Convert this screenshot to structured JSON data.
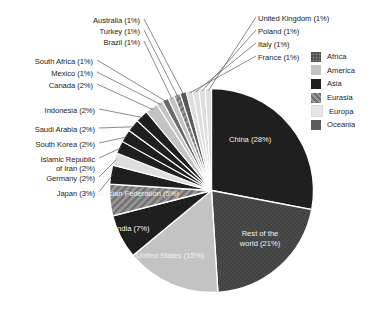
{
  "chart_data": {
    "type": "pie",
    "title": "",
    "subtitle": "",
    "xlabel": "",
    "ylabel": "",
    "legend_position": "right",
    "grid": false,
    "units": "percent",
    "categories": [
      "China",
      "Rest of the world",
      "United States",
      "India",
      "Russian Federation",
      "Japan",
      "Germany",
      "Islamic Republic of Iran",
      "South Korea",
      "Saudi Arabia",
      "Indonesia",
      "Canada",
      "Mexico",
      "South Africa",
      "Brazil",
      "Turkey",
      "Australia",
      "France",
      "Italy",
      "Poland",
      "United Kingdom"
    ],
    "values": [
      28,
      21,
      15,
      7,
      5,
      3,
      2,
      2,
      2,
      2,
      2,
      2,
      1,
      1,
      1,
      1,
      1,
      1,
      1,
      1,
      1
    ],
    "slices": [
      {
        "label": "China (28%)",
        "name": "China",
        "value": 28,
        "group": "Asia",
        "color": "#1f1f1f",
        "pattern": "solid"
      },
      {
        "label": "Rest of the world (21%)",
        "name": "Rest of the world",
        "value": 21,
        "group": "Africa",
        "color": "#4a4a4a",
        "pattern": "dots"
      },
      {
        "label": "United States (15%)",
        "name": "United States",
        "value": 15,
        "group": "America",
        "color": "#c3c3c3",
        "pattern": "solid"
      },
      {
        "label": "India (7%)",
        "name": "India",
        "value": 7,
        "group": "Asia",
        "color": "#1f1f1f",
        "pattern": "solid"
      },
      {
        "label": "Russian Federation (5%)",
        "name": "Russian Federation",
        "value": 5,
        "group": "Eurasia",
        "color": "#8c8c8c",
        "pattern": "hatch"
      },
      {
        "label": "Japan (3%)",
        "name": "Japan",
        "value": 3,
        "group": "Asia",
        "color": "#1f1f1f",
        "pattern": "solid"
      },
      {
        "label": "Germany (2%)",
        "name": "Germany",
        "value": 2,
        "group": "Europa",
        "color": "#dedede",
        "pattern": "solid"
      },
      {
        "label": "Islamic Republic of Iran (2%)",
        "name": "Islamic Republic of Iran",
        "value": 2,
        "group": "Asia",
        "color": "#1f1f1f",
        "pattern": "solid"
      },
      {
        "label": "South Korea (2%)",
        "name": "South Korea",
        "value": 2,
        "group": "Asia",
        "color": "#1f1f1f",
        "pattern": "solid"
      },
      {
        "label": "Saudi Arabia (2%)",
        "name": "Saudi Arabia",
        "value": 2,
        "group": "Asia",
        "color": "#1f1f1f",
        "pattern": "solid"
      },
      {
        "label": "Indonesia (2%)",
        "name": "Indonesia",
        "value": 2,
        "group": "Asia",
        "color": "#1f1f1f",
        "pattern": "solid"
      },
      {
        "label": "Canada (2%)",
        "name": "Canada",
        "value": 2,
        "group": "America",
        "color": "#c3c3c3",
        "pattern": "solid"
      },
      {
        "label": "Mexico (1%)",
        "name": "Mexico",
        "value": 1,
        "group": "America",
        "color": "#c3c3c3",
        "pattern": "solid"
      },
      {
        "label": "South Africa (1%)",
        "name": "South Africa",
        "value": 1,
        "group": "Africa",
        "color": "#6e6e6e",
        "pattern": "dots"
      },
      {
        "label": "Brazil (1%)",
        "name": "Brazil",
        "value": 1,
        "group": "America",
        "color": "#c3c3c3",
        "pattern": "solid"
      },
      {
        "label": "Turkey (1%)",
        "name": "Turkey",
        "value": 1,
        "group": "Eurasia",
        "color": "#8c8c8c",
        "pattern": "hatch"
      },
      {
        "label": "Australia (1%)",
        "name": "Australia",
        "value": 1,
        "group": "Oceania",
        "color": "#5a5a5a",
        "pattern": "solid"
      },
      {
        "label": "France (1%)",
        "name": "France",
        "value": 1,
        "group": "Europa",
        "color": "#dedede",
        "pattern": "solid"
      },
      {
        "label": "Italy (1%)",
        "name": "Italy",
        "value": 1,
        "group": "Europa",
        "color": "#dedede",
        "pattern": "solid"
      },
      {
        "label": "Poland (1%)",
        "name": "Poland",
        "value": 1,
        "group": "Europa",
        "color": "#dedede",
        "pattern": "solid"
      },
      {
        "label": "United Kingdom (1%)",
        "name": "United Kingdom",
        "value": 1,
        "group": "Europa",
        "color": "#dedede",
        "pattern": "solid"
      }
    ],
    "legend": [
      {
        "label": "Africa",
        "color": "#6e6e6e",
        "pattern": "dots"
      },
      {
        "label": "America",
        "color": "#c3c3c3",
        "pattern": "solid"
      },
      {
        "label": "Asia",
        "color": "#1f1f1f",
        "pattern": "solid"
      },
      {
        "label": "Eurasia",
        "color": "#8c8c8c",
        "pattern": "hatch"
      },
      {
        "label": "Europa",
        "color": "#e6e6e6",
        "pattern": "solid"
      },
      {
        "label": "Oceania",
        "color": "#5a5a5a",
        "pattern": "solid"
      }
    ]
  },
  "inner_labels": [
    {
      "text": "China (28%)",
      "lines": [
        "China (28%)"
      ]
    },
    {
      "text": "Rest of the world (21%)",
      "lines": [
        "Rest of the",
        "world (21%)"
      ]
    },
    {
      "text": "United States (15%)",
      "lines": [
        "United States (15%)"
      ]
    },
    {
      "text": "India (7%)",
      "lines": [
        "India (7%)"
      ]
    },
    {
      "text": "Russian Federation (5%)",
      "lines": [
        "Russian Federation (5%)"
      ]
    }
  ],
  "callouts_left": [
    {
      "text": "Australia (1%)"
    },
    {
      "text": "Turkey (1%)"
    },
    {
      "text": "Brazil (1%)"
    },
    {
      "text": "South Africa (1%)"
    },
    {
      "text": "Mexico (1%)"
    },
    {
      "text": "Canada (2%)"
    },
    {
      "text": "Indonesia (2%)"
    },
    {
      "text": "Saudi Arabia (2%)"
    },
    {
      "text": "South Korea (2%)"
    },
    {
      "text": "Islamic Republic",
      "text2": "of Iran (2%)"
    },
    {
      "text": "Germany (2%)"
    },
    {
      "text": "Japan (3%)"
    }
  ],
  "callouts_right": [
    {
      "text": "United Kingdom (1%)"
    },
    {
      "text": "Poland (1%)"
    },
    {
      "text": "Italy (1%)"
    },
    {
      "text": "France (1%)"
    }
  ]
}
